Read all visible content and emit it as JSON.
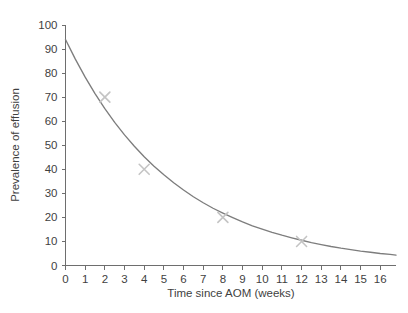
{
  "chart_data": {
    "type": "line",
    "title": "",
    "subtitle": "",
    "xlabel": "Time since AOM (weeks)",
    "ylabel": "Prevalence of effusion",
    "xlim": [
      0,
      16.8
    ],
    "ylim": [
      0,
      100
    ],
    "grid": false,
    "legend": null,
    "x_ticks": [
      0,
      1,
      2,
      3,
      4,
      5,
      6,
      7,
      8,
      9,
      10,
      11,
      12,
      13,
      14,
      15,
      16
    ],
    "x_tick_labels": [
      "0",
      "1",
      "2",
      "3",
      "4",
      "5",
      "6",
      "7",
      "8",
      "9",
      "10",
      "11",
      "12",
      "13",
      "14",
      "15",
      "16"
    ],
    "y_ticks": [
      0,
      10,
      20,
      30,
      40,
      50,
      60,
      70,
      80,
      90,
      100
    ],
    "y_tick_labels": [
      "0",
      "10",
      "20",
      "30",
      "40",
      "50",
      "60",
      "70",
      "80",
      "90",
      "100"
    ],
    "series": [
      {
        "name": "Fitted exponential decay curve",
        "type": "line",
        "color": "#7d7d7d",
        "x": [
          0,
          0.5,
          1,
          1.5,
          2,
          2.5,
          3,
          3.5,
          4,
          4.5,
          5,
          5.5,
          6,
          6.5,
          7,
          7.5,
          8,
          8.5,
          9,
          9.5,
          10,
          10.5,
          11,
          11.5,
          12,
          12.5,
          13,
          13.5,
          14,
          14.5,
          15,
          15.5,
          16,
          16.5,
          16.8
        ],
        "y": [
          94,
          85.8,
          78.3,
          71.5,
          65.2,
          59.5,
          54.3,
          49.6,
          45.2,
          41.3,
          37.7,
          34.4,
          31.4,
          28.6,
          26.1,
          23.8,
          21.8,
          19.9,
          18.1,
          16.5,
          15.1,
          13.8,
          12.6,
          11.5,
          10.5,
          9.5,
          8.7,
          7.9,
          7.2,
          6.6,
          6.0,
          5.5,
          5.0,
          4.6,
          4.3
        ]
      },
      {
        "name": "Observed prevalence",
        "type": "scatter",
        "marker": "x",
        "color": "#c4c4c4",
        "points": [
          {
            "x": 2,
            "y": 70
          },
          {
            "x": 4,
            "y": 40
          },
          {
            "x": 8,
            "y": 20
          },
          {
            "x": 12,
            "y": 10
          }
        ]
      }
    ]
  },
  "axes": {
    "x_title": "Time since AOM (weeks)",
    "y_title": "Prevalence of effusion"
  }
}
